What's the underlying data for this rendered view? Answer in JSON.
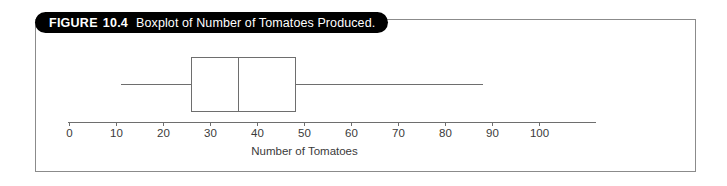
{
  "figure": {
    "label": "FIGURE",
    "number": "10.4",
    "caption": "Boxplot of Number of Tomatoes Produced."
  },
  "colors": {
    "banner_background": "#000000",
    "banner_text": "#ffffff",
    "frame_border": "#8b8b8b",
    "axis_line": "#6e6e6e",
    "box_stroke": "#6e6e6e",
    "tick_text": "#3a3a3a",
    "page_background": "#ffffff"
  },
  "chart_data": {
    "type": "boxplot",
    "title": "Boxplot of Number of Tomatoes Produced.",
    "xlabel": "Number of Tomatoes",
    "ylabel": "",
    "orientation": "horizontal",
    "grid": false,
    "legend": "none",
    "xlim": [
      0,
      112
    ],
    "xticks": [
      0,
      10,
      20,
      30,
      40,
      50,
      60,
      70,
      80,
      90,
      100
    ],
    "xticklabels": [
      "0",
      "10",
      "20",
      "30",
      "40",
      "50",
      "60",
      "70",
      "80",
      "90",
      "100"
    ],
    "series": [
      {
        "name": "Number of Tomatoes",
        "min": 11,
        "q1": 26,
        "median": 36,
        "q3": 48,
        "max": 88,
        "outliers": []
      }
    ]
  }
}
